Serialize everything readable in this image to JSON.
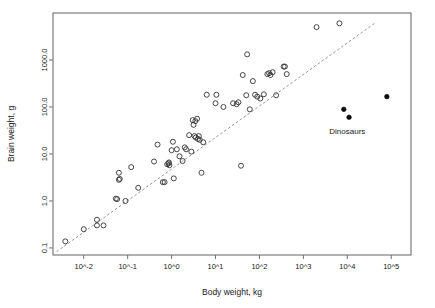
{
  "chart_data": {
    "type": "scatter",
    "title": "",
    "xlabel": "Body weight, kg",
    "ylabel": "Brain weight, g",
    "xscale": "log10",
    "yscale": "log10",
    "xlim": [
      -2.7,
      5.45
    ],
    "ylim": [
      -1.15,
      4.0
    ],
    "grid": false,
    "legend": false,
    "xticks": [
      {
        "value": -2,
        "label": "10^-2"
      },
      {
        "value": -1,
        "label": "10^-1"
      },
      {
        "value": 0,
        "label": "10^0"
      },
      {
        "value": 1,
        "label": "10^1"
      },
      {
        "value": 2,
        "label": "10^2"
      },
      {
        "value": 3,
        "label": "10^3"
      },
      {
        "value": 4,
        "label": "10^4"
      },
      {
        "value": 5,
        "label": "10^5"
      }
    ],
    "yticks": [
      {
        "value": -1,
        "label": "0.1"
      },
      {
        "value": 0,
        "label": "1.0"
      },
      {
        "value": 1,
        "label": "10.0"
      },
      {
        "value": 2,
        "label": "100.0"
      },
      {
        "value": 3,
        "label": "1000.0"
      }
    ],
    "annotations": [
      {
        "text": "Dinosaurs",
        "x": 4.0,
        "y": 1.42
      }
    ],
    "trend_line": {
      "style": "dashed",
      "color": "#8a8a8a",
      "x_start": -2.62,
      "y_start": -1.08,
      "x_end": 4.62,
      "y_end": 3.78
    },
    "series": [
      {
        "name": "Mammals",
        "marker": "open-circle",
        "color": "#333333",
        "points": [
          [
            -2.42,
            -0.86
          ],
          [
            -2.0,
            -0.6
          ],
          [
            -1.7,
            -0.4
          ],
          [
            -1.7,
            -0.52
          ],
          [
            -1.55,
            -0.52
          ],
          [
            -1.27,
            0.05
          ],
          [
            -1.24,
            0.04
          ],
          [
            -1.2,
            0.6
          ],
          [
            -1.2,
            0.45
          ],
          [
            -1.18,
            0.47
          ],
          [
            -1.05,
            0.0
          ],
          [
            -0.92,
            0.72
          ],
          [
            -0.76,
            0.28
          ],
          [
            -0.4,
            0.84
          ],
          [
            -0.32,
            1.2
          ],
          [
            -0.2,
            0.4
          ],
          [
            -0.16,
            0.4
          ],
          [
            -0.1,
            0.78
          ],
          [
            -0.07,
            0.8
          ],
          [
            -0.06,
            0.82
          ],
          [
            -0.05,
            0.76
          ],
          [
            0.0,
            1.08
          ],
          [
            0.03,
            1.26
          ],
          [
            0.05,
            0.48
          ],
          [
            0.12,
            1.1
          ],
          [
            0.18,
            0.95
          ],
          [
            0.25,
            0.85
          ],
          [
            0.3,
            1.14
          ],
          [
            0.33,
            1.1
          ],
          [
            0.4,
            1.4
          ],
          [
            0.45,
            1.05
          ],
          [
            0.48,
            1.72
          ],
          [
            0.5,
            1.62
          ],
          [
            0.52,
            1.38
          ],
          [
            0.54,
            1.7
          ],
          [
            0.55,
            1.35
          ],
          [
            0.58,
            1.75
          ],
          [
            0.6,
            1.32
          ],
          [
            0.62,
            1.38
          ],
          [
            0.64,
            1.3
          ],
          [
            0.68,
            0.6
          ],
          [
            0.72,
            1.25
          ],
          [
            0.8,
            2.26
          ],
          [
            1.0,
            2.08
          ],
          [
            1.02,
            2.26
          ],
          [
            1.18,
            2.0
          ],
          [
            1.4,
            2.08
          ],
          [
            1.48,
            2.06
          ],
          [
            1.52,
            2.1
          ],
          [
            1.58,
            0.75
          ],
          [
            1.62,
            2.68
          ],
          [
            1.7,
            2.25
          ],
          [
            1.72,
            3.12
          ],
          [
            1.78,
            1.95
          ],
          [
            1.85,
            2.55
          ],
          [
            1.9,
            2.26
          ],
          [
            1.95,
            2.22
          ],
          [
            2.02,
            2.18
          ],
          [
            2.1,
            2.27
          ],
          [
            2.18,
            2.7
          ],
          [
            2.22,
            2.72
          ],
          [
            2.25,
            2.68
          ],
          [
            2.3,
            2.74
          ],
          [
            2.38,
            2.25
          ],
          [
            2.55,
            2.86
          ],
          [
            2.58,
            2.86
          ],
          [
            2.62,
            2.7
          ],
          [
            3.3,
            3.7
          ],
          [
            3.82,
            3.78
          ]
        ]
      },
      {
        "name": "Dinosaurs",
        "marker": "filled-circle",
        "color": "#0d0d0d",
        "points": [
          [
            3.92,
            1.95
          ],
          [
            4.04,
            1.78
          ],
          [
            4.9,
            2.22
          ]
        ]
      }
    ]
  },
  "layout": {
    "plot_left": 53,
    "plot_right": 411,
    "plot_top": 13,
    "plot_bottom": 255
  }
}
